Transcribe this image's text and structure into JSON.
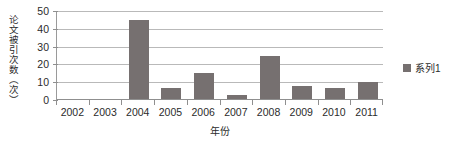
{
  "chart_data": {
    "type": "bar",
    "title": "",
    "subtitle": "",
    "xlabel": "年份",
    "ylabel": "论文被引次数（次）",
    "categories": [
      "2002",
      "2003",
      "2004",
      "2005",
      "2006",
      "2007",
      "2008",
      "2009",
      "2010",
      "2011"
    ],
    "values": [
      0,
      0,
      45,
      7,
      15,
      3,
      25,
      8,
      7,
      10
    ],
    "series": [
      {
        "name": "系列1",
        "color": "#767070",
        "values": [
          0,
          0,
          45,
          7,
          15,
          3,
          25,
          8,
          7,
          10
        ]
      }
    ],
    "ylim": [
      0,
      50
    ],
    "yticks": [
      0,
      10,
      20,
      30,
      40,
      50
    ],
    "ytick_labels": [
      "0",
      "10",
      "20",
      "30",
      "40",
      "50"
    ],
    "grid": true,
    "grid_axis": "y",
    "legend": [
      "系列1"
    ],
    "legend_position": "right",
    "bar_color": "#767070",
    "gridline_color": "#b9b9b9",
    "axis_color": "#8f8f8f",
    "background": "#ffffff"
  }
}
